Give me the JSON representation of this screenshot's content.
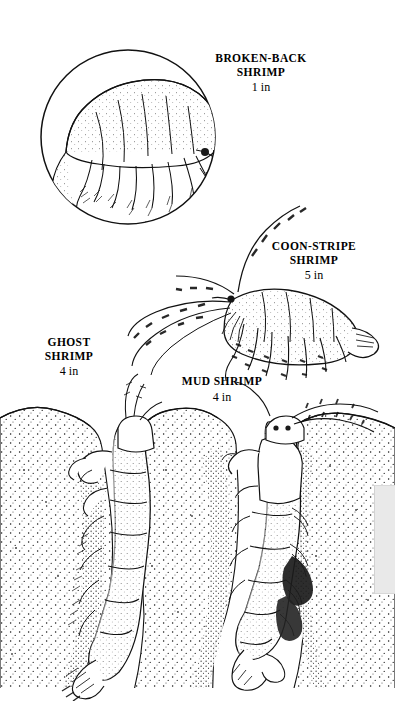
{
  "plate": {
    "title": "Shrimps",
    "background_color": "#ffffff",
    "ink_color": "#000000",
    "width": 395,
    "height": 701,
    "style": "pen-and-ink stipple field-guide illustration"
  },
  "top_crop": {
    "fragment": "SHRIMPS"
  },
  "species": [
    {
      "id": "broken-back-shrimp",
      "name": "BROKEN-BACK\nSHRIMP",
      "size": "1 in",
      "vignette": "circle",
      "orientation": "humped body facing left, tail curled below"
    },
    {
      "id": "coon-stripe-shrimp",
      "name": "COON-STRIPE\nSHRIMP",
      "size": "5 in",
      "vignette": "none",
      "orientation": "body facing left with long banded antennae sweeping left and up"
    },
    {
      "id": "ghost-shrimp",
      "name": "GHOST\nSHRIMP",
      "size": "4 in",
      "vignette": "burrow",
      "orientation": "head-up in vertical burrow, left side of sediment cross-section"
    },
    {
      "id": "mud-shrimp",
      "name": "MUD SHRIMP",
      "size": "4 in",
      "vignette": "burrow",
      "orientation": "head-up in vertical burrow, right side of sediment cross-section"
    }
  ],
  "scene": {
    "sediment_label": "stippled sediment cross-section",
    "surface_y": 412,
    "burrow_count": 2
  },
  "side_tab": {
    "color": "#e9e9e9",
    "label": ""
  }
}
